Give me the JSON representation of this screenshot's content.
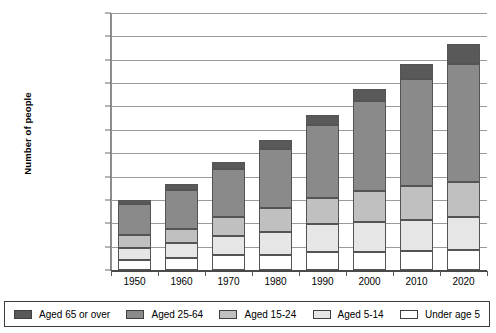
{
  "chart_data": {
    "type": "bar",
    "subtype": "stacked-bar",
    "title": "",
    "xlabel": "",
    "ylabel": "Number of people",
    "categories": [
      "1950",
      "1960",
      "1970",
      "1980",
      "1990",
      "2000",
      "2010",
      "2020"
    ],
    "ylim": [
      0,
      8800000000
    ],
    "ytick_step": 800000000,
    "ytick_labels": [
      "8,800,000,000",
      "8,000,000,000",
      "7,200,000,000",
      "6,400,000,000",
      "5,600,000,000",
      "4,800,000,000",
      "4,000,000,000",
      "3,200,000,000",
      "2,400,000,000",
      "1,600,000,000",
      "800,000,000",
      "0"
    ],
    "ytick_values": [
      8800000000,
      8000000000,
      7200000000,
      6400000000,
      5600000000,
      4800000000,
      4000000000,
      3200000000,
      2400000000,
      1600000000,
      800000000,
      0
    ],
    "grid": true,
    "legend_position": "bottom",
    "stack_order_bottom_to_top": [
      "Under age 5",
      "Aged 5-14",
      "Aged 15-24",
      "Aged 25-64",
      "Aged 65 or over"
    ],
    "series": [
      {
        "name": "Under age 5",
        "color": "#ffffff",
        "values": [
          340000000,
          420000000,
          530000000,
          530000000,
          630000000,
          610000000,
          640000000,
          670000000
        ]
      },
      {
        "name": "Aged 5-14",
        "color": "#e6e6e6",
        "values": [
          400000000,
          490000000,
          650000000,
          770000000,
          930000000,
          1040000000,
          1080000000,
          1130000000
        ]
      },
      {
        "name": "Aged 15-24",
        "color": "#c0c0c0",
        "values": [
          450000000,
          490000000,
          620000000,
          810000000,
          920000000,
          1050000000,
          1150000000,
          1200000000
        ]
      },
      {
        "name": "Aged 25-64",
        "color": "#8a8a8a",
        "values": [
          1070000000,
          1350000000,
          1670000000,
          2050000000,
          2500000000,
          3080000000,
          3660000000,
          4050000000
        ]
      },
      {
        "name": "Aged 65 or over",
        "color": "#595959",
        "values": [
          140000000,
          200000000,
          230000000,
          280000000,
          340000000,
          420000000,
          520000000,
          700000000
        ]
      }
    ],
    "totals": [
      2400000000,
      2950000000,
      3700000000,
      4440000000,
      5320000000,
      6200000000,
      7050000000,
      7750000000
    ]
  },
  "legend": {
    "items": [
      {
        "label": "Aged 65 or over",
        "color": "#595959"
      },
      {
        "label": "Aged 25-64",
        "color": "#8a8a8a"
      },
      {
        "label": "Aged 15-24",
        "color": "#c0c0c0"
      },
      {
        "label": "Aged 5-14",
        "color": "#e6e6e6"
      },
      {
        "label": "Under age 5",
        "color": "#ffffff"
      }
    ]
  }
}
